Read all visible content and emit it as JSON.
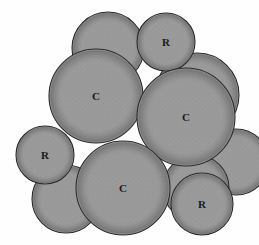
{
  "figure": {
    "background_color": "#fefefe",
    "particle_fill_color": "#9a9a9a",
    "particle_outline_color": "#2b2b2b",
    "speckle_color": "#5d5d5d",
    "label_color": "#1a1a1a",
    "canvas": {
      "width": 259,
      "height": 245
    }
  },
  "legend": {
    "coarse_symbol": "C",
    "fine_symbol": "R"
  },
  "chart_data": {
    "type": "scatter",
    "xlabel": "",
    "ylabel": "",
    "xlim": [
      0,
      259
    ],
    "ylim": [
      0,
      245
    ],
    "grid": false,
    "legend_position": "none",
    "note": "Each datum is a circular particle: cx, cy in pixel coords (origin top-left), r in pixels. 'label' is the printed glyph; empty means unlabelled particle.",
    "particles": [
      {
        "id": "p1",
        "label": "",
        "cx": 108,
        "cy": 48,
        "r": 36,
        "z": 1
      },
      {
        "id": "p2",
        "label": "R",
        "cx": 166,
        "cy": 42,
        "r": 29,
        "z": 2
      },
      {
        "id": "p3",
        "label": "",
        "cx": 197,
        "cy": 95,
        "r": 42,
        "z": 1
      },
      {
        "id": "p4",
        "label": "C",
        "cx": 96,
        "cy": 96,
        "r": 47,
        "z": 3
      },
      {
        "id": "p5",
        "label": "C",
        "cx": 186,
        "cy": 117,
        "r": 49,
        "z": 4
      },
      {
        "id": "p6",
        "label": "",
        "cx": 236,
        "cy": 162,
        "r": 33,
        "z": 2
      },
      {
        "id": "p7",
        "label": "R",
        "cx": 45,
        "cy": 155,
        "r": 29,
        "z": 3
      },
      {
        "id": "p8",
        "label": "",
        "cx": 66,
        "cy": 199,
        "r": 34,
        "z": 2
      },
      {
        "id": "p9",
        "label": "C",
        "cx": 123,
        "cy": 188,
        "r": 47,
        "z": 4
      },
      {
        "id": "p10",
        "label": "",
        "cx": 196,
        "cy": 188,
        "r": 33,
        "z": 3
      },
      {
        "id": "p11",
        "label": "R",
        "cx": 202,
        "cy": 204,
        "r": 31,
        "z": 5
      }
    ],
    "labels": [
      {
        "text": "R",
        "x": 166,
        "y": 42,
        "font_size": 11
      },
      {
        "text": "C",
        "x": 96,
        "y": 96,
        "font_size": 11
      },
      {
        "text": "C",
        "x": 186,
        "y": 117,
        "font_size": 11
      },
      {
        "text": "R",
        "x": 45,
        "y": 155,
        "font_size": 11
      },
      {
        "text": "C",
        "x": 123,
        "y": 188,
        "font_size": 11
      },
      {
        "text": "R",
        "x": 202,
        "y": 204,
        "font_size": 11
      }
    ]
  }
}
